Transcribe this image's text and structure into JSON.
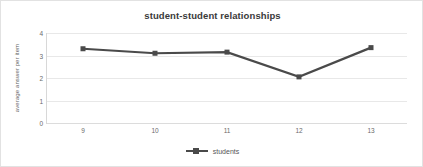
{
  "chart_data": {
    "type": "line",
    "title": "student-student relationships",
    "xlabel": "",
    "ylabel": "average answer per item",
    "categories": [
      "9",
      "10",
      "11",
      "12",
      "13"
    ],
    "x": [
      9,
      10,
      11,
      12,
      13
    ],
    "series": [
      {
        "name": "students",
        "values": [
          3.3,
          3.1,
          3.15,
          2.05,
          3.35
        ]
      }
    ],
    "ylim": [
      0,
      4
    ],
    "y_ticks": [
      "4",
      "3",
      "2",
      "1",
      "0"
    ],
    "y_tick_values": [
      4,
      3,
      2,
      1,
      0
    ],
    "grid": true,
    "legend_position": "bottom",
    "colors": {
      "series_line": "#4a4a4a",
      "marker": "#4a4a4a",
      "gridline": "#e8e8e8",
      "title_text": "#3a3a3a",
      "axis_text": "#6a6a6a",
      "border": "#e2e2e2",
      "background": "#ffffff"
    }
  },
  "legend": {
    "entries": [
      {
        "label": "students",
        "marker": "square-line-marker"
      }
    ]
  }
}
